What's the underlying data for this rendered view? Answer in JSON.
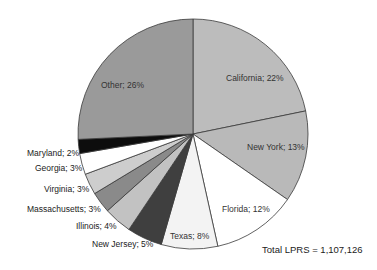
{
  "chart_data": {
    "type": "pie",
    "title": "",
    "start_angle_deg": 0,
    "direction": "clockwise",
    "slices": [
      {
        "label": "California",
        "value": 22,
        "text": "California; 22%",
        "color": "#bcbcbc"
      },
      {
        "label": "New York",
        "value": 13,
        "text": "New York; 13%",
        "color": "#b9b9b9"
      },
      {
        "label": "Florida",
        "value": 12,
        "text": "Florida; 12%",
        "color": "#ffffff"
      },
      {
        "label": "Texas",
        "value": 8,
        "text": "Texas; 8%",
        "color": "#f3f3f3"
      },
      {
        "label": "New Jersey",
        "value": 5,
        "text": "New Jersey; 5%",
        "color": "#3f3f3f"
      },
      {
        "label": "Illinois",
        "value": 4,
        "text": "Illinois; 4%",
        "color": "#c2c2c2"
      },
      {
        "label": "Massachusetts",
        "value": 3,
        "text": "Massachusetts; 3%",
        "color": "#8a8a8a"
      },
      {
        "label": "Virginia",
        "value": 3,
        "text": "Virginia; 3%",
        "color": "#cdcdcd"
      },
      {
        "label": "Georgia",
        "value": 3,
        "text": "Georgia; 3%",
        "color": "#ffffff"
      },
      {
        "label": "Maryland",
        "value": 2,
        "text": "Maryland; 2%",
        "color": "#0d0d0d"
      },
      {
        "label": "Other",
        "value": 26,
        "text": "Other; 26%",
        "color": "#9a9a9a"
      }
    ],
    "annotation": "Total LPRS = 1,107,126"
  },
  "labels": {
    "california": "California; 22%",
    "new_york": "New York; 13%",
    "florida": "Florida; 12%",
    "texas": "Texas; 8%",
    "new_jersey": "New Jersey; 5%",
    "illinois": "Illinois; 4%",
    "massachusetts": "Massachusetts; 3%",
    "virginia": "Virginia; 3%",
    "georgia": "Georgia; 3%",
    "maryland": "Maryland; 2%",
    "other": "Other; 26%",
    "total": "Total LPRS = 1,107,126"
  }
}
